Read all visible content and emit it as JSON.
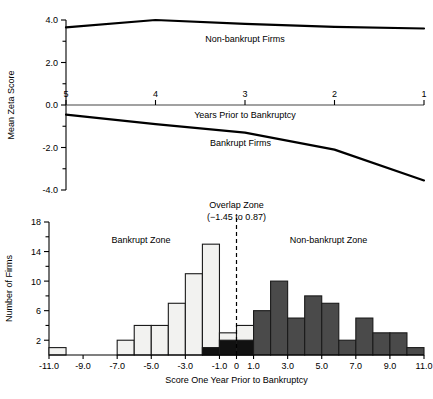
{
  "figure": {
    "background": "#ffffff",
    "ink": "#000000"
  },
  "chart_data": [
    {
      "type": "line",
      "id": "mean-zeta-score-trend",
      "title": "",
      "xlabel": "Years Prior to Bankruptcy",
      "ylabel": "Mean Zeta Score",
      "x": [
        5,
        4,
        3,
        2,
        1
      ],
      "xlim": [
        5,
        1
      ],
      "ylim": [
        -4.0,
        4.0
      ],
      "xticklabels": [
        "5",
        "4",
        "3",
        "2",
        "1"
      ],
      "yticks": [
        -4.0,
        -2.0,
        0.0,
        2.0,
        4.0
      ],
      "yticklabels": [
        "-4.0",
        "-2.0",
        "0.0",
        "2.0",
        "4.0"
      ],
      "yminorticks": [
        -3.0,
        -1.0,
        1.0,
        3.0
      ],
      "grid": false,
      "legend_position": "inline-annotations",
      "series": [
        {
          "name": "Non-bankrupt Firms",
          "values": [
            3.65,
            4.0,
            3.82,
            3.68,
            3.6
          ],
          "label_x": 3.0,
          "label_y": 2.95
        },
        {
          "name": "Bankrupt Firms",
          "values": [
            -0.45,
            -0.9,
            -1.3,
            -2.1,
            -3.55
          ],
          "label_x": 3.05,
          "label_y": -1.92
        }
      ],
      "axis_note": "zero line drawn as the x-axis with tick labels above it"
    },
    {
      "type": "bar",
      "id": "score-one-year-prior-histogram",
      "title": "",
      "xlabel": "Score One Year Prior to Bankruptcy",
      "ylabel": "Number of Firms",
      "xlim": [
        -11.0,
        11.0
      ],
      "ylim": [
        0,
        18
      ],
      "bin_width": 1.0,
      "xticks": [
        -11.0,
        -9.0,
        -7.0,
        -5.0,
        -3.0,
        -1.0,
        0,
        1.0,
        3.0,
        5.0,
        7.0,
        9.0,
        11.0
      ],
      "xticklabels": [
        "-11.0",
        "-9.0",
        "-7.0",
        "-5.0",
        "-3.0",
        "-1.0",
        "0",
        "1.0",
        "3.0",
        "5.0",
        "7.0",
        "9.0",
        "11.0"
      ],
      "yticks": [
        2,
        6,
        10,
        14,
        18
      ],
      "yticklabels": [
        "2",
        "6",
        "10",
        "14",
        "18"
      ],
      "yminorticks": [
        4,
        8,
        12,
        16
      ],
      "grid": false,
      "legend_position": "inline-zone-labels",
      "series": [
        {
          "name": "Bankrupt firms",
          "color": "#f2f2f0",
          "bin_starts": [
            -11,
            -10,
            -9,
            -8,
            -7,
            -6,
            -5,
            -4,
            -3,
            -2,
            -1,
            0
          ],
          "values": [
            1,
            0,
            0,
            0,
            2,
            4,
            4,
            7,
            11,
            15,
            3,
            4
          ]
        },
        {
          "name": "Non-bankrupt firms",
          "color": "#4a4a4a",
          "bin_starts": [
            -2,
            -1,
            0,
            1,
            2,
            3,
            4,
            5,
            6,
            7,
            8,
            9,
            10
          ],
          "values": [
            1,
            2,
            2,
            6,
            10,
            5,
            8,
            7,
            2,
            5,
            3,
            3,
            1
          ]
        }
      ],
      "overlap_fill": "#111111",
      "annotations": [
        {
          "name": "bankrupt-zone-label",
          "text": "Bankrupt Zone",
          "x": -5.6,
          "y": 15.1
        },
        {
          "name": "nonbankrupt-zone-label",
          "text": "Non-bankrupt Zone",
          "x": 5.4,
          "y": 15.1
        },
        {
          "name": "overlap-zone-label-line1",
          "text": "Overlap Zone",
          "x": 0.0,
          "y": 19.9
        },
        {
          "name": "overlap-zone-label-line2",
          "text": "(−1.45 to 0.87)",
          "x": 0.0,
          "y": 18.3
        }
      ],
      "divider": {
        "name": "overlap-divider",
        "x": 0.0,
        "style": "dashed"
      }
    }
  ]
}
